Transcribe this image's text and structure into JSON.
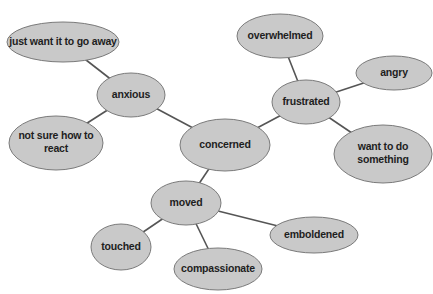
{
  "diagram": {
    "type": "mind-map",
    "colors": {
      "node_fill": "#c9c9c9",
      "node_stroke": "#7a7a7a",
      "edge": "#555555",
      "text": "#1e1e1e",
      "background": "#ffffff"
    },
    "nodes": [
      {
        "id": "concerned",
        "lines": [
          "concerned"
        ],
        "cx": 225,
        "cy": 145,
        "rx": 45,
        "ry": 26
      },
      {
        "id": "anxious",
        "lines": [
          "anxious"
        ],
        "cx": 131,
        "cy": 95,
        "rx": 34,
        "ry": 22
      },
      {
        "id": "just-want-it-to-go-away",
        "lines": [
          "just want it to go away"
        ],
        "cx": 63,
        "cy": 42,
        "rx": 56,
        "ry": 20
      },
      {
        "id": "not-sure-how-to-react",
        "lines": [
          "not sure how to",
          "react"
        ],
        "cx": 56,
        "cy": 143,
        "rx": 47,
        "ry": 27
      },
      {
        "id": "frustrated",
        "lines": [
          "frustrated"
        ],
        "cx": 306,
        "cy": 102,
        "rx": 34,
        "ry": 22
      },
      {
        "id": "overwhelmed",
        "lines": [
          "overwhelmed"
        ],
        "cx": 280,
        "cy": 36,
        "rx": 43,
        "ry": 22
      },
      {
        "id": "angry",
        "lines": [
          "angry"
        ],
        "cx": 394,
        "cy": 73,
        "rx": 38,
        "ry": 17
      },
      {
        "id": "want-to-do-something",
        "lines": [
          "want to do",
          "something"
        ],
        "cx": 383,
        "cy": 154,
        "rx": 49,
        "ry": 29
      },
      {
        "id": "moved",
        "lines": [
          "moved"
        ],
        "cx": 186,
        "cy": 203,
        "rx": 35,
        "ry": 22
      },
      {
        "id": "touched",
        "lines": [
          "touched"
        ],
        "cx": 121,
        "cy": 247,
        "rx": 30,
        "ry": 23
      },
      {
        "id": "compassionate",
        "lines": [
          "compassionate"
        ],
        "cx": 218,
        "cy": 269,
        "rx": 44,
        "ry": 21
      },
      {
        "id": "emboldened",
        "lines": [
          "emboldened"
        ],
        "cx": 314,
        "cy": 235,
        "rx": 44,
        "ry": 18
      }
    ],
    "edges": [
      {
        "from": "concerned",
        "to": "anxious"
      },
      {
        "from": "concerned",
        "to": "frustrated"
      },
      {
        "from": "concerned",
        "to": "moved"
      },
      {
        "from": "anxious",
        "to": "just-want-it-to-go-away"
      },
      {
        "from": "anxious",
        "to": "not-sure-how-to-react"
      },
      {
        "from": "frustrated",
        "to": "overwhelmed"
      },
      {
        "from": "frustrated",
        "to": "angry"
      },
      {
        "from": "frustrated",
        "to": "want-to-do-something"
      },
      {
        "from": "moved",
        "to": "touched"
      },
      {
        "from": "moved",
        "to": "compassionate"
      },
      {
        "from": "moved",
        "to": "emboldened"
      }
    ]
  }
}
